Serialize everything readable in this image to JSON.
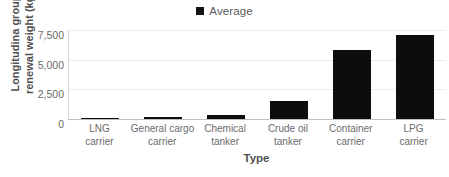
{
  "chart_data": {
    "type": "bar",
    "title": "",
    "subtitle": "",
    "xlabel": "Type",
    "ylabel_line1": "Longitudina group",
    "ylabel_line2": "renewal weight (kg)",
    "ylabel": "Longitudina group renewal weight (kg)",
    "categories": [
      "LNG carrier",
      "General cargo carrier",
      "Chemical tanker",
      "Crude oil tanker",
      "Container carrier",
      "LPG carrier"
    ],
    "category_lines": [
      [
        "LNG",
        "carrier"
      ],
      [
        "General cargo",
        "carrier"
      ],
      [
        "Chemical",
        "tanker"
      ],
      [
        "Crude oil",
        "tanker"
      ],
      [
        "Container",
        "carrier"
      ],
      [
        "LPG",
        "carrier"
      ]
    ],
    "series": [
      {
        "name": "Average",
        "values": [
          30,
          200,
          350,
          1550,
          5800,
          7100
        ],
        "color": "#0d0d0d"
      }
    ],
    "ylim": [
      0,
      7500
    ],
    "yticks": [
      0,
      2500,
      5000,
      7500
    ],
    "ytick_labels": [
      "0",
      "2,500",
      "5,000",
      "7,500"
    ],
    "grid": true,
    "legend": {
      "position": "top-center",
      "entries": [
        {
          "label": "Average",
          "color": "#0d0d0d",
          "marker": "square"
        }
      ]
    },
    "colors": {
      "bar": "#0d0d0d",
      "gridline": "#ebebeb",
      "axis": "#bfbfbf",
      "text": "#6b6b6b",
      "title_text": "#4f4f4f",
      "background": "#ffffff"
    }
  }
}
